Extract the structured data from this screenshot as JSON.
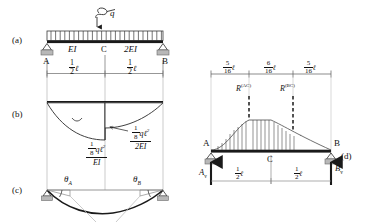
{
  "figure": {
    "type": "structural-beam-diagram",
    "panels": [
      "(a)",
      "(b)",
      "(c)",
      "(d)"
    ],
    "ink_color": "#1a1a1a",
    "support_color": "#9a9a9a",
    "thin_line_color": "#a8a8a8"
  },
  "panel_a": {
    "tag": "(a)",
    "load_label": "q",
    "left_segment_stiffness": "EI",
    "right_segment_stiffness": "2EI",
    "node_left": "A",
    "node_mid": "C",
    "node_right": "B",
    "dim_left_num": "1",
    "dim_left_den": "2",
    "dim_left_unit": "ℓ",
    "dim_right_num": "1",
    "dim_right_den": "2",
    "dim_right_unit": "ℓ"
  },
  "panel_b": {
    "tag": "(b)",
    "left_value_num": "1",
    "left_value_den": "8",
    "left_value_expr": "qℓ",
    "left_value_pow": "2",
    "left_value_bottom": "EI",
    "right_value_num": "1",
    "right_value_den": "8",
    "right_value_expr": "qℓ",
    "right_value_pow": "2",
    "right_value_bottom": "2EI"
  },
  "panel_c": {
    "tag": "(c)",
    "theta_left": "θ",
    "theta_left_sub": "A",
    "theta_right": "θ",
    "theta_right_sub": "B"
  },
  "panel_d": {
    "tag": "(d)",
    "dims": [
      {
        "num": "5",
        "den": "16",
        "unit": "ℓ"
      },
      {
        "num": "6",
        "den": "16",
        "unit": "ℓ"
      },
      {
        "num": "5",
        "den": "16",
        "unit": "ℓ"
      }
    ],
    "resultant_left": "R",
    "resultant_left_sup": "(AC)",
    "resultant_right": "R",
    "resultant_right_sup": "(BC)",
    "node_left": "A",
    "node_mid": "C",
    "node_right": "B",
    "reaction_left": "A",
    "reaction_left_sub": "v",
    "reaction_right": "B",
    "reaction_right_sub": "v",
    "span_left_num": "1",
    "span_left_den": "2",
    "span_left_unit": "ℓ",
    "span_right_num": "1",
    "span_right_den": "2",
    "span_right_unit": "ℓ"
  }
}
